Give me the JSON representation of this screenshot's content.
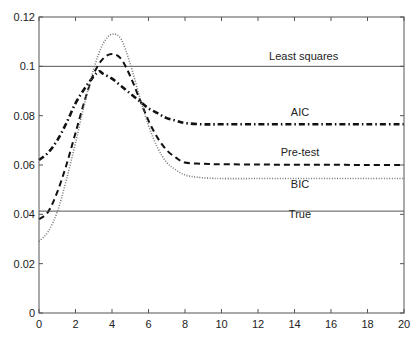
{
  "chart_data": {
    "type": "line",
    "title": "",
    "xlabel": "",
    "ylabel": "",
    "xlim": [
      0,
      20
    ],
    "ylim": [
      0,
      0.12
    ],
    "grid": false,
    "legend": "inline annotations",
    "x_ticks": [
      "0",
      "2",
      "4",
      "6",
      "8",
      "10",
      "12",
      "14",
      "16",
      "18",
      "20"
    ],
    "y_ticks": [
      "0",
      "0.02",
      "0.04",
      "0.06",
      "0.08",
      "0.1",
      "0.12"
    ],
    "series": [
      {
        "name": "Least squares",
        "style": "solid-thin",
        "x": [
          0,
          20
        ],
        "y": [
          0.1,
          0.1
        ]
      },
      {
        "name": "AIC",
        "style": "dash-dot-thick",
        "x": [
          0,
          0.5,
          1,
          1.5,
          2,
          2.5,
          3,
          3.3,
          3.5,
          4,
          4.5,
          5,
          5.5,
          6,
          6.5,
          7,
          7.5,
          8,
          9,
          10,
          12,
          14,
          16,
          18,
          20
        ],
        "y": [
          0.062,
          0.065,
          0.07,
          0.077,
          0.085,
          0.091,
          0.096,
          0.098,
          0.097,
          0.095,
          0.092,
          0.089,
          0.086,
          0.083,
          0.081,
          0.079,
          0.078,
          0.077,
          0.0765,
          0.0765,
          0.0765,
          0.0765,
          0.0765,
          0.0765,
          0.0765
        ]
      },
      {
        "name": "Pre-test",
        "style": "dashed",
        "x": [
          0,
          0.5,
          1,
          1.5,
          2,
          2.5,
          3,
          3.5,
          4,
          4.5,
          5,
          5.5,
          6,
          6.5,
          7,
          7.5,
          8,
          9,
          10,
          12,
          14,
          16,
          18,
          20
        ],
        "y": [
          0.038,
          0.041,
          0.049,
          0.06,
          0.073,
          0.086,
          0.097,
          0.103,
          0.105,
          0.103,
          0.096,
          0.087,
          0.078,
          0.071,
          0.066,
          0.063,
          0.061,
          0.0605,
          0.0603,
          0.0602,
          0.0601,
          0.0601,
          0.06,
          0.06
        ]
      },
      {
        "name": "BIC",
        "style": "dotted",
        "x": [
          0,
          0.5,
          1,
          1.5,
          2,
          2.5,
          3,
          3.5,
          4,
          4.5,
          5,
          5.5,
          6,
          6.5,
          7,
          7.5,
          8,
          8.5,
          9,
          9.5,
          10,
          12,
          14,
          16,
          18,
          20
        ],
        "y": [
          0.029,
          0.033,
          0.041,
          0.054,
          0.069,
          0.085,
          0.099,
          0.109,
          0.113,
          0.111,
          0.101,
          0.088,
          0.076,
          0.067,
          0.061,
          0.058,
          0.056,
          0.0552,
          0.0548,
          0.0546,
          0.0545,
          0.0545,
          0.0545,
          0.0545,
          0.0545,
          0.0545
        ]
      },
      {
        "name": "True",
        "style": "solid-thin",
        "x": [
          0,
          20
        ],
        "y": [
          0.0413,
          0.0413
        ]
      }
    ],
    "annotations": [
      {
        "text": "Least squares",
        "x": 14.5,
        "y": 0.1025
      },
      {
        "text": "AIC",
        "x": 14.3,
        "y": 0.08
      },
      {
        "text": "Pre-test",
        "x": 14.3,
        "y": 0.0635
      },
      {
        "text": "BIC",
        "x": 14.3,
        "y": 0.0505
      },
      {
        "text": "True",
        "x": 14.3,
        "y": 0.0385
      }
    ]
  }
}
